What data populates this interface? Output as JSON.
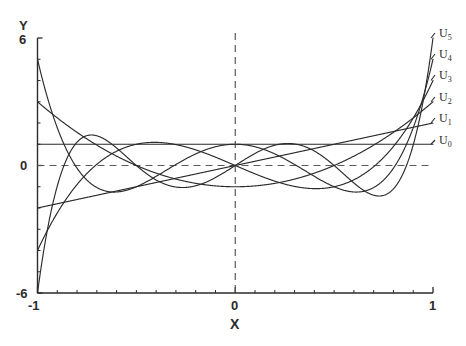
{
  "figure": {
    "kind": "line-plot",
    "background": "#ffffff",
    "ink_color": "#2b2b2b"
  },
  "axes": {
    "y_title": "Y",
    "x_title": "X",
    "y_ticks": [
      "6",
      "0",
      "-6"
    ],
    "x_ticks": [
      "-1",
      "0",
      "1"
    ]
  },
  "chart_data": {
    "type": "line",
    "title": "",
    "subtitle": "",
    "xlabel": "X",
    "ylabel": "Y",
    "xlim": [
      -1,
      1
    ],
    "ylim": [
      -6,
      6
    ],
    "grid": false,
    "legend_position": "right-of-axes",
    "reference_lines": [
      {
        "name": "y-zero-dashed",
        "orientation": "horizontal",
        "value": 0,
        "style": "dashed"
      },
      {
        "name": "x-zero-dashed",
        "orientation": "vertical",
        "value": 0,
        "style": "dashed"
      }
    ],
    "annotations": [
      "U_0",
      "U_1",
      "U_2",
      "U_3",
      "U_4",
      "U_5"
    ],
    "x": [
      -1,
      -0.95,
      -0.9,
      -0.85,
      -0.8,
      -0.75,
      -0.7,
      -0.65,
      -0.6,
      -0.55,
      -0.5,
      -0.45,
      -0.4,
      -0.35,
      -0.3,
      -0.25,
      -0.2,
      -0.15,
      -0.1,
      -0.05,
      0,
      0.05,
      0.1,
      0.15,
      0.2,
      0.25,
      0.3,
      0.35,
      0.4,
      0.45,
      0.5,
      0.55,
      0.6,
      0.65,
      0.7,
      0.75,
      0.8,
      0.85,
      0.9,
      0.95,
      1
    ],
    "series": [
      {
        "name": "U_0",
        "label": "U",
        "sub": "0",
        "endpoint_left": 1,
        "endpoint_right": 1,
        "values": [
          1,
          1,
          1,
          1,
          1,
          1,
          1,
          1,
          1,
          1,
          1,
          1,
          1,
          1,
          1,
          1,
          1,
          1,
          1,
          1,
          1,
          1,
          1,
          1,
          1,
          1,
          1,
          1,
          1,
          1,
          1,
          1,
          1,
          1,
          1,
          1,
          1,
          1,
          1,
          1,
          1
        ]
      },
      {
        "name": "U_1",
        "label": "U",
        "sub": "1",
        "endpoint_left": -2,
        "endpoint_right": 2,
        "values": [
          -2,
          -1.9,
          -1.8,
          -1.7,
          -1.6,
          -1.5,
          -1.4,
          -1.3,
          -1.2,
          -1.1,
          -1,
          -0.9,
          -0.8,
          -0.7,
          -0.6,
          -0.5,
          -0.4,
          -0.3,
          -0.2,
          -0.1,
          0,
          0.1,
          0.2,
          0.3,
          0.4,
          0.5,
          0.6,
          0.7,
          0.8,
          0.9,
          1,
          1.1,
          1.2,
          1.3,
          1.4,
          1.5,
          1.6,
          1.7,
          1.8,
          1.9,
          2
        ]
      },
      {
        "name": "U_2",
        "label": "U",
        "sub": "2",
        "endpoint_left": 3,
        "endpoint_right": 3,
        "values": [
          3,
          2.61,
          2.24,
          1.89,
          1.56,
          1.25,
          0.96,
          0.69,
          0.44,
          0.21,
          0,
          -0.19,
          -0.36,
          -0.51,
          -0.64,
          -0.75,
          -0.84,
          -0.91,
          -0.96,
          -0.99,
          -1,
          -0.99,
          -0.96,
          -0.91,
          -0.84,
          -0.75,
          -0.64,
          -0.51,
          -0.36,
          -0.19,
          0,
          0.21,
          0.44,
          0.69,
          0.96,
          1.25,
          1.56,
          1.89,
          2.24,
          2.61,
          3
        ]
      },
      {
        "name": "U_3",
        "label": "U",
        "sub": "3",
        "endpoint_left": -4,
        "endpoint_right": 4,
        "values": [
          -4,
          -3.33,
          -2.74,
          -2.21,
          -1.74,
          -1.31,
          -0.94,
          -0.61,
          -0.32,
          -0.07,
          0,
          0.14,
          0.29,
          0.41,
          0.5,
          0.56,
          0.58,
          0.56,
          0.5,
          0.4,
          0,
          -0.4,
          -0.5,
          -0.56,
          -0.58,
          -0.56,
          -0.5,
          -0.41,
          -0.29,
          -0.14,
          0,
          0.07,
          0.32,
          0.61,
          0.94,
          1.31,
          1.74,
          2.21,
          2.74,
          3.33,
          4
        ]
      },
      {
        "name": "U_4",
        "label": "U",
        "sub": "4",
        "endpoint_left": 5,
        "endpoint_right": 5,
        "values": [
          5,
          3.95,
          3.08,
          2.35,
          1.76,
          1.27,
          0.88,
          0.56,
          0.31,
          0.12,
          -0.04,
          -0.16,
          -0.25,
          -0.32,
          -0.36,
          -0.39,
          -0.4,
          -0.4,
          -0.4,
          -0.4,
          1,
          -0.4,
          -0.4,
          -0.4,
          -0.4,
          -0.39,
          -0.36,
          -0.32,
          -0.25,
          -0.16,
          -0.04,
          0.12,
          0.31,
          0.56,
          0.88,
          1.27,
          1.76,
          2.35,
          3.08,
          3.95,
          5
        ]
      },
      {
        "name": "U_5",
        "label": "U",
        "sub": "5",
        "endpoint_left": -6,
        "endpoint_right": 6,
        "values": [
          -6,
          -4.48,
          -3.28,
          -2.33,
          -1.6,
          -1.05,
          -0.63,
          -0.33,
          -0.11,
          0.04,
          0.13,
          0.19,
          0.21,
          0.22,
          0.21,
          0.19,
          0.15,
          0.11,
          0.07,
          0.04,
          0,
          -0.04,
          -0.07,
          -0.11,
          -0.15,
          -0.19,
          -0.21,
          -0.22,
          -0.21,
          -0.19,
          -0.13,
          -0.04,
          0.11,
          0.33,
          0.63,
          1.05,
          1.6,
          2.33,
          3.28,
          4.48,
          6
        ]
      }
    ]
  },
  "legend": [
    {
      "label": "U",
      "sub": "5",
      "top": 27
    },
    {
      "label": "U",
      "sub": "4",
      "top": 48
    },
    {
      "label": "U",
      "sub": "3",
      "top": 69
    },
    {
      "label": "U",
      "sub": "2",
      "top": 91
    },
    {
      "label": "U",
      "sub": "1",
      "top": 112
    },
    {
      "label": "U",
      "sub": "0",
      "top": 134
    }
  ]
}
